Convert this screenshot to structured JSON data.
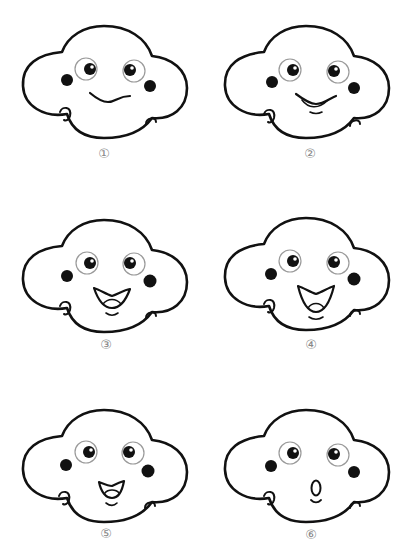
{
  "colors": {
    "outline": "#111111",
    "eye_ring": "#9a9a9a",
    "label": "#888888",
    "background": "#ffffff"
  },
  "faces": [
    {
      "label": "①",
      "mouth": "wavy-line"
    },
    {
      "label": "②",
      "mouth": "slight-open-smile"
    },
    {
      "label": "③",
      "mouth": "open-smile"
    },
    {
      "label": "④",
      "mouth": "wide-open-smile"
    },
    {
      "label": "⑤",
      "mouth": "small-open-smile"
    },
    {
      "label": "⑥",
      "mouth": "o-shape"
    }
  ]
}
